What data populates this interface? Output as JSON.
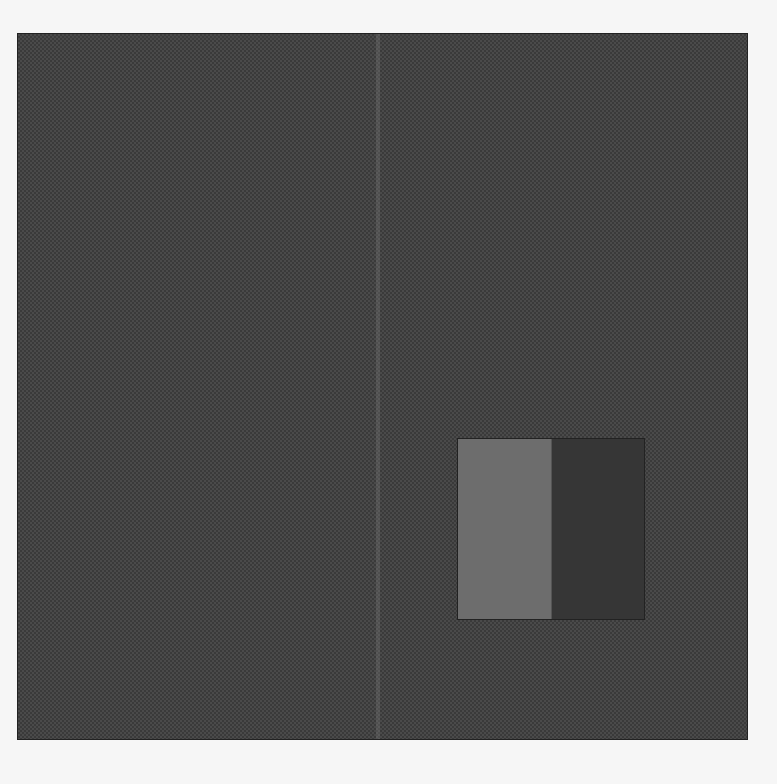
{
  "header": {
    "text": ""
  },
  "panel": {
    "pattern": "halftone-checker",
    "base_color": "#4a4a4a",
    "pattern_color": "#3a3a3a"
  },
  "swatch": {
    "light_color": "#6d6d6d",
    "dark_color": "#363636"
  },
  "page": {
    "background": "#f6f6f6"
  }
}
